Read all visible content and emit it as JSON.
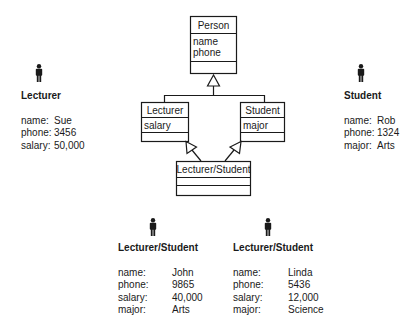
{
  "class_diagram": {
    "classes": [
      {
        "name": "Person",
        "attributes": [
          "name",
          "phone"
        ]
      },
      {
        "name": "Lecturer",
        "attributes": [
          "salary"
        ]
      },
      {
        "name": "Student",
        "attributes": [
          "major"
        ]
      },
      {
        "name": "Lecturer/Student",
        "attributes": []
      }
    ],
    "generalizations": [
      {
        "from": "Lecturer",
        "to": "Person"
      },
      {
        "from": "Student",
        "to": "Person"
      },
      {
        "from": "Lecturer/Student",
        "to": "Lecturer"
      },
      {
        "from": "Lecturer/Student",
        "to": "Student"
      }
    ]
  },
  "objects": {
    "lecturer": {
      "icon": "person-icon",
      "title": "Lecturer",
      "fields": [
        {
          "label": "name:",
          "value": "Sue"
        },
        {
          "label": "phone:",
          "value": "3456"
        },
        {
          "label": "salary:",
          "value": "50,000"
        }
      ]
    },
    "student": {
      "icon": "person-icon",
      "title": "Student",
      "fields": [
        {
          "label": "name:",
          "value": "Rob"
        },
        {
          "label": "phone:",
          "value": "1324"
        },
        {
          "label": "major:",
          "value": "Arts"
        }
      ]
    },
    "lecturer_student_1": {
      "icon": "person-icon",
      "title": "Lecturer/Student",
      "fields": [
        {
          "label": "name:",
          "value": "John"
        },
        {
          "label": "phone:",
          "value": "9865"
        },
        {
          "label": "salary:",
          "value": "40,000"
        },
        {
          "label": "major:",
          "value": "Arts"
        }
      ]
    },
    "lecturer_student_2": {
      "icon": "person-icon",
      "title": "Lecturer/Student",
      "fields": [
        {
          "label": "name:",
          "value": "Linda"
        },
        {
          "label": "phone:",
          "value": "5436"
        },
        {
          "label": "salary:",
          "value": "12,000"
        },
        {
          "label": "major:",
          "value": "Science"
        }
      ]
    }
  }
}
